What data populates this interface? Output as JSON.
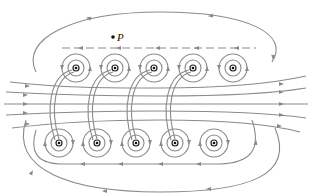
{
  "figure": {
    "point_label": "P",
    "colors": {
      "field_line": "#8a8a8a",
      "wire": "#111111",
      "background": "#ffffff"
    },
    "top_row": {
      "current_direction": "out-of-page",
      "symbol": "dot",
      "x": [
        76,
        115,
        154,
        193,
        233
      ],
      "y": 68
    },
    "bottom_row": {
      "current_direction": "into-page",
      "symbol": "dot",
      "x": [
        59,
        97,
        136,
        175,
        214
      ],
      "y": 143
    },
    "interior_field_direction": "left-to-right"
  }
}
